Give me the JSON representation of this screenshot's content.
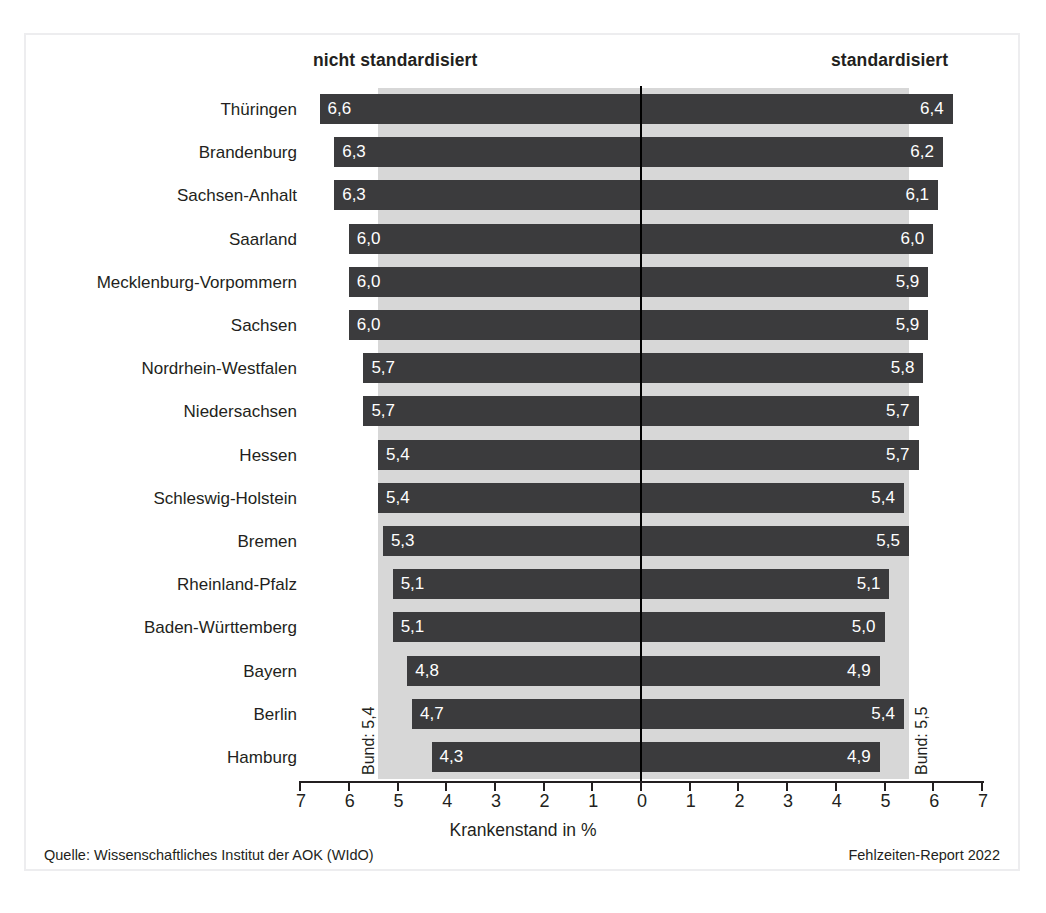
{
  "headers": {
    "left": "nicht standardisiert",
    "right": "standardisiert"
  },
  "axis": {
    "title": "Krankenstand in %",
    "ticks": [
      "7",
      "6",
      "5",
      "4",
      "3",
      "2",
      "1",
      "0",
      "1",
      "2",
      "3",
      "4",
      "5",
      "6",
      "7"
    ],
    "max": 7
  },
  "reference": {
    "left_label": "Bund: 5,4",
    "right_label": "Bund: 5,5",
    "left_value": 5.4,
    "right_value": 5.5
  },
  "footer": {
    "source": "Quelle: Wissenschaftliches Institut der AOK (WIdO)",
    "report": "Fehlzeiten-Report 2022"
  },
  "colors": {
    "bar": "#3b3b3d",
    "band": "#d7d7d7",
    "frame": "#ededef",
    "text": "#231f20",
    "bar_label": "#ffffff",
    "axis": "#231f20"
  },
  "chart_data": {
    "type": "bar",
    "orientation": "horizontal-diverging",
    "title": "",
    "xlabel": "Krankenstand in %",
    "ylabel": "",
    "xlim": [
      7,
      7
    ],
    "grid": false,
    "legend_position": "top",
    "categories": [
      "Thüringen",
      "Brandenburg",
      "Sachsen-Anhalt",
      "Saarland",
      "Mecklenburg-Vorpommern",
      "Sachsen",
      "Nordrhein-Westfalen",
      "Niedersachsen",
      "Hessen",
      "Schleswig-Holstein",
      "Bremen",
      "Rheinland-Pfalz",
      "Baden-Württemberg",
      "Bayern",
      "Berlin",
      "Hamburg"
    ],
    "series": [
      {
        "name": "nicht standardisiert",
        "side": "left",
        "values": [
          6.6,
          6.3,
          6.3,
          6.0,
          6.0,
          6.0,
          5.7,
          5.7,
          5.4,
          5.4,
          5.3,
          5.1,
          5.1,
          4.8,
          4.7,
          4.3
        ],
        "labels": [
          "6,6",
          "6,3",
          "6,3",
          "6,0",
          "6,0",
          "6,0",
          "5,7",
          "5,7",
          "5,4",
          "5,4",
          "5,3",
          "5,1",
          "5,1",
          "4,8",
          "4,7",
          "4,3"
        ],
        "reference": 5.4,
        "reference_label": "Bund: 5,4"
      },
      {
        "name": "standardisiert",
        "side": "right",
        "values": [
          6.4,
          6.2,
          6.1,
          6.0,
          5.9,
          5.9,
          5.8,
          5.7,
          5.7,
          5.4,
          5.5,
          5.1,
          5.0,
          4.9,
          5.4,
          4.9
        ],
        "labels": [
          "6,4",
          "6,2",
          "6,1",
          "6,0",
          "5,9",
          "5,9",
          "5,8",
          "5,7",
          "5,7",
          "5,4",
          "5,5",
          "5,1",
          "5,0",
          "4,9",
          "5,4",
          "4,9"
        ],
        "reference": 5.5,
        "reference_label": "Bund: 5,5"
      }
    ],
    "source": "Quelle: Wissenschaftliches Institut der AOK (WIdO)",
    "note": "Fehlzeiten-Report 2022"
  }
}
